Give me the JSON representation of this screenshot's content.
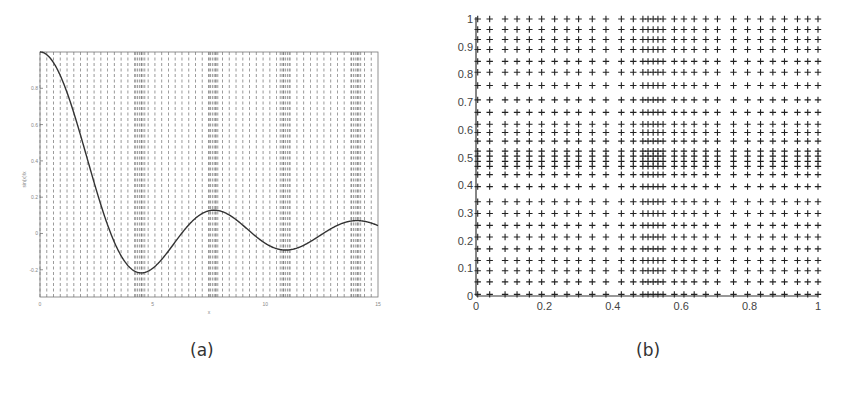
{
  "chart_data": [
    {
      "id": "a",
      "type": "line",
      "title": "",
      "xlabel": "x",
      "ylabel": "sin(x)/x",
      "function": "sin(x)/x",
      "xlim": [
        0,
        15
      ],
      "ylim": [
        -0.35,
        1.0
      ],
      "xticks": [
        0,
        5,
        10,
        15
      ],
      "xtick_labels": [
        "0",
        "5",
        "10",
        "15"
      ],
      "yticks": [
        0.8,
        0.6,
        0.4,
        0.2,
        0,
        -0.2
      ],
      "ytick_labels": [
        "0.8",
        "0.6",
        "0.4",
        "0.2",
        "0",
        "-0.2"
      ],
      "grid": "dense vertical dashed lines (sample points)",
      "series": [
        {
          "name": "sin(x)/x",
          "x": [
            0,
            1,
            2,
            3,
            4,
            4.49,
            5,
            6,
            7,
            7.73,
            8,
            9,
            10,
            10.9,
            12,
            13,
            14,
            14.07,
            15
          ],
          "y": [
            1.0,
            0.841,
            0.455,
            0.047,
            -0.189,
            -0.217,
            -0.192,
            -0.047,
            0.094,
            0.128,
            0.124,
            0.046,
            -0.054,
            -0.091,
            -0.045,
            0.032,
            0.071,
            0.071,
            0.043
          ]
        }
      ],
      "caption": "(a)"
    },
    {
      "id": "b",
      "type": "scatter",
      "title": "",
      "xlabel": "",
      "ylabel": "",
      "marker": "+",
      "xlim": [
        0,
        1
      ],
      "ylim": [
        0,
        1
      ],
      "xticks": [
        0,
        0.2,
        0.4,
        0.6,
        0.8,
        1
      ],
      "xtick_labels": [
        "0",
        "0.2",
        "0.4",
        "0.6",
        "0.8",
        "1"
      ],
      "yticks": [
        0,
        0.1,
        0.2,
        0.3,
        0.4,
        0.5,
        0.6,
        0.7,
        0.8,
        0.9,
        1
      ],
      "ytick_labels": [
        "0",
        "0.1",
        "0.2",
        "0.3",
        "0.4",
        "0.5",
        "0.6",
        "0.7",
        "0.8",
        "0.9",
        "1"
      ],
      "grid": "off",
      "description": "Adaptive mesh point grid, refined near x=0.5 and y=0.5",
      "grid_columns_x": [
        0.005,
        0.04,
        0.085,
        0.12,
        0.156,
        0.192,
        0.23,
        0.266,
        0.3,
        0.34,
        0.38,
        0.425,
        0.46,
        0.488,
        0.503,
        0.518,
        0.532,
        0.547,
        0.58,
        0.608,
        0.638,
        0.672,
        0.706,
        0.753,
        0.794,
        0.832,
        0.868,
        0.902,
        0.94,
        0.97,
        1.0
      ],
      "grid_rows_y": [
        1.0,
        0.962,
        0.926,
        0.89,
        0.847,
        0.808,
        0.76,
        0.708,
        0.663,
        0.62,
        0.59,
        0.559,
        0.523,
        0.505,
        0.486,
        0.468,
        0.438,
        0.395,
        0.34,
        0.298,
        0.255,
        0.213,
        0.17,
        0.128,
        0.091,
        0.051,
        0.006
      ],
      "caption": "(b)"
    }
  ],
  "captions": {
    "a": "(a)",
    "b": "(b)"
  }
}
